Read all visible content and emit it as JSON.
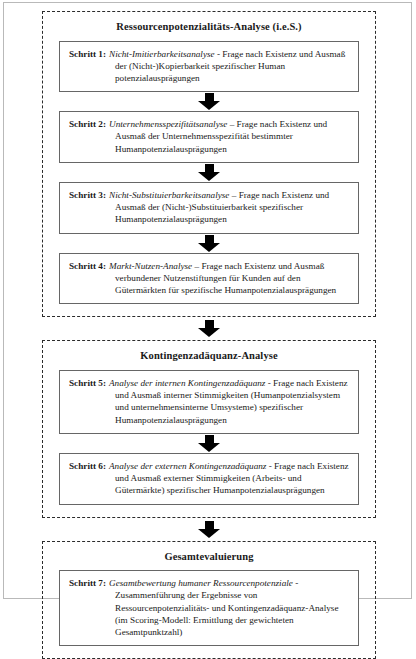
{
  "diagram": {
    "groups": [
      {
        "id": "group-ressourcenpotenzialitaets-analyse",
        "title": "Ressourcenpotenzialitäts-Analyse (i.e.S.)",
        "steps": [
          {
            "id": "schritt-1",
            "label": "Schritt 1:",
            "italic": "Nicht-Imitierbarkeitsanalyse",
            "rest": " - Frage nach Existenz und Ausmaß der (Nicht-)Kopierbarkeit spezifischer Human potenzialausprägungen"
          },
          {
            "id": "schritt-2",
            "label": "Schritt 2:",
            "italic": "Unternehmensspezifitätsanalyse",
            "rest": " – Frage nach Existenz und Ausmaß der Unternehmensspezifität bestimmter Humanpotenzialausprägungen"
          },
          {
            "id": "schritt-3",
            "label": "Schritt 3:",
            "italic": "Nicht-Substituierbarkeitsanalyse",
            "rest": " – Frage nach Existenz und Ausmaß der (Nicht-)Substituierbarkeit spezifischer Humanpotenzialausprägungen"
          },
          {
            "id": "schritt-4",
            "label": "Schritt 4:",
            "italic": "Markt-Nutzen-Analyse",
            "rest": " – Frage nach Existenz und Ausmaß verbundener Nutzenstiftungen für Kunden auf den Gütermärkten für spezifische Humanpotenzialausprägungen"
          }
        ]
      },
      {
        "id": "group-kontingenzadaequanz-analyse",
        "title": "Kontingenzadäquanz-Analyse",
        "steps": [
          {
            "id": "schritt-5",
            "label": "Schritt 5:",
            "italic": "Analyse der internen Kontingenzadäquanz",
            "rest": " - Frage nach Existenz und Ausmaß interner Stimmigkeiten (Humanpotenzialsystem und unternehmensinterne Umsysteme) spezifischer Humanpotenzialausprägungen"
          },
          {
            "id": "schritt-6",
            "label": "Schritt 6:",
            "italic": "Analyse der externen Kontingenzadäquanz",
            "rest": " - Frage nach Existenz und Ausmaß externer Stimmigkeiten (Arbeits- und Gütermärkte) spezifischer Humanpotenzialausprägungen"
          }
        ]
      },
      {
        "id": "group-gesamtevaluierung",
        "title": "Gesamtevaluierung",
        "steps": [
          {
            "id": "schritt-7",
            "label": "Schritt 7:",
            "italic": "Gesamtbewertung humaner Ressourcenpotenziale",
            "rest": " - Zusammenführung der Ergebnisse von Ressourcenpotenzialitäts- und Kontingenzadäquanz-Analyse (im Scoring-Modell: Ermittlung der gewichteten Gesamtpunktzahl)"
          }
        ]
      }
    ],
    "colors": {
      "arrow": "#000000",
      "box_border": "#666666",
      "group_border": "#2b2b2b",
      "frame": "#b9b9b9",
      "text": "#1a1a1a"
    }
  }
}
